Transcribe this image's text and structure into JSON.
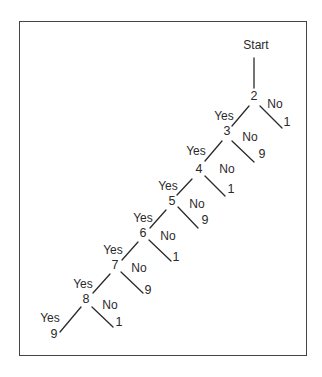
{
  "diagram": {
    "root": {
      "label": "Start",
      "x": 256,
      "y": 45
    },
    "root_line": {
      "x1": 254,
      "y1": 58,
      "x2": 254,
      "y2": 88
    },
    "nodes": [
      {
        "id": "2",
        "label": "2",
        "x": 254,
        "y": 96,
        "yes": {
          "label": "Yes",
          "x": 224,
          "y": 116
        },
        "no": {
          "label": "No",
          "x": 275,
          "y": 104,
          "leaf": "1",
          "leaf_x": 287,
          "leaf_y": 122
        },
        "no_line": {
          "x1": 260,
          "y1": 106,
          "x2": 282,
          "y2": 128
        },
        "yes_line": {
          "x1": 249,
          "y1": 106,
          "x2": 232,
          "y2": 126
        }
      },
      {
        "id": "3",
        "label": "3",
        "x": 227,
        "y": 131,
        "yes": {
          "label": "Yes",
          "x": 196,
          "y": 151
        },
        "no": {
          "label": "No",
          "x": 250,
          "y": 137,
          "leaf": "9",
          "leaf_x": 262,
          "leaf_y": 154
        },
        "no_line": {
          "x1": 232,
          "y1": 141,
          "x2": 254,
          "y2": 162
        },
        "yes_line": {
          "x1": 222,
          "y1": 141,
          "x2": 205,
          "y2": 161
        }
      },
      {
        "id": "4",
        "label": "4",
        "x": 199,
        "y": 169,
        "yes": {
          "label": "Yes",
          "x": 168,
          "y": 186
        },
        "no": {
          "label": "No",
          "x": 227,
          "y": 169,
          "leaf": "1",
          "leaf_x": 231,
          "leaf_y": 189
        },
        "no_line": {
          "x1": 205,
          "y1": 176,
          "x2": 225,
          "y2": 196
        },
        "yes_line": {
          "x1": 192,
          "y1": 179,
          "x2": 177,
          "y2": 195
        }
      },
      {
        "id": "5",
        "label": "5",
        "x": 172,
        "y": 201,
        "yes": {
          "label": "Yes",
          "x": 143,
          "y": 218
        },
        "no": {
          "label": "No",
          "x": 197,
          "y": 204,
          "leaf": "9",
          "leaf_x": 205,
          "leaf_y": 220
        },
        "no_line": {
          "x1": 178,
          "y1": 207,
          "x2": 198,
          "y2": 228
        },
        "yes_line": {
          "x1": 166,
          "y1": 210,
          "x2": 150,
          "y2": 228
        }
      },
      {
        "id": "6",
        "label": "6",
        "x": 143,
        "y": 233,
        "yes": {
          "label": "Yes",
          "x": 113,
          "y": 250
        },
        "no": {
          "label": "No",
          "x": 168,
          "y": 236,
          "leaf": "1",
          "leaf_x": 176,
          "leaf_y": 257
        },
        "no_line": {
          "x1": 149,
          "y1": 240,
          "x2": 171,
          "y2": 261
        },
        "yes_line": {
          "x1": 138,
          "y1": 242,
          "x2": 122,
          "y2": 260
        }
      },
      {
        "id": "7",
        "label": "7",
        "x": 115,
        "y": 265,
        "yes": {
          "label": "Yes",
          "x": 83,
          "y": 284
        },
        "no": {
          "label": "No",
          "x": 139,
          "y": 268,
          "leaf": "9",
          "leaf_x": 148,
          "leaf_y": 290
        },
        "no_line": {
          "x1": 121,
          "y1": 272,
          "x2": 143,
          "y2": 293
        },
        "yes_line": {
          "x1": 110,
          "y1": 274,
          "x2": 93,
          "y2": 293
        }
      },
      {
        "id": "8",
        "label": "8",
        "x": 86,
        "y": 299,
        "yes": {
          "label": "Yes",
          "x": 50,
          "y": 318
        },
        "no": {
          "label": "No",
          "x": 110,
          "y": 305,
          "leaf": "1",
          "leaf_x": 119,
          "leaf_y": 322
        },
        "no_line": {
          "x1": 92,
          "y1": 307,
          "x2": 113,
          "y2": 327
        },
        "yes_line": {
          "x1": 81,
          "y1": 307,
          "x2": 60,
          "y2": 332
        }
      }
    ],
    "final": {
      "label": "9",
      "x": 54,
      "y": 334
    }
  }
}
